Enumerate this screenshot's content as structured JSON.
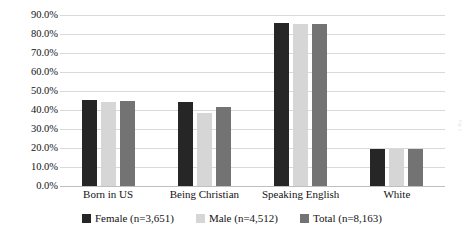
{
  "chart_data": {
    "type": "bar",
    "title": "",
    "xlabel": "",
    "ylabel": "",
    "ylim": [
      0,
      90
    ],
    "ytick_step": 10,
    "ytick_labels": [
      "0.0%",
      "10.0%",
      "20.0%",
      "30.0%",
      "40.0%",
      "50.0%",
      "60.0%",
      "70.0%",
      "80.0%",
      "90.0%"
    ],
    "grid": true,
    "legend_position": "bottom",
    "categories": [
      "Born in US",
      "Being Christian",
      "Speaking English",
      "White"
    ],
    "series": [
      {
        "name": "Female (n=3,651)",
        "color": "#262626",
        "values": [
          45.5,
          44.4,
          85.7,
          19.6
        ]
      },
      {
        "name": "Male (n=4,512)",
        "color": "#d6d6d6",
        "values": [
          44.0,
          38.6,
          85.2,
          19.3
        ]
      },
      {
        "name": "Total (n=8,163)",
        "color": "#737373",
        "values": [
          45.0,
          41.8,
          85.4,
          19.6
        ]
      }
    ]
  },
  "watermark": {
    "text": "fig 1"
  }
}
